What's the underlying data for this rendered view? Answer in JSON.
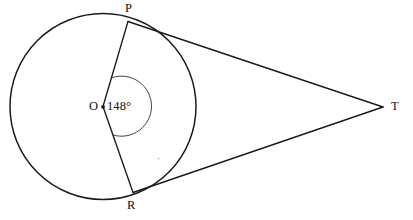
{
  "figure": {
    "type": "circle-tangent-geometry-diagram",
    "background_color": "#ffffff",
    "stroke_color": "#1a1a1a",
    "width": 413,
    "height": 220
  },
  "labels": {
    "point_p": "P",
    "point_r": "R",
    "point_t": "T",
    "center_o": "O",
    "angle_value": "148°"
  },
  "geometry": {
    "circle": {
      "center_x": 103,
      "center_y": 106.5,
      "radius": 93
    },
    "points": {
      "P": {
        "x": 128,
        "y": 22
      },
      "R": {
        "x": 133,
        "y": 192
      },
      "T": {
        "x": 383,
        "y": 107
      },
      "O": {
        "x": 103,
        "y": 107
      }
    },
    "segments": [
      {
        "name": "OP",
        "from": "O",
        "to": "P"
      },
      {
        "name": "OR",
        "from": "O",
        "to": "R"
      },
      {
        "name": "PT",
        "from": "P",
        "to": "T"
      },
      {
        "name": "RT",
        "from": "R",
        "to": "T"
      }
    ],
    "angle_arc": {
      "vertex": "O",
      "radius": 30,
      "measure_degrees": 148,
      "side": "reflex-right"
    }
  }
}
